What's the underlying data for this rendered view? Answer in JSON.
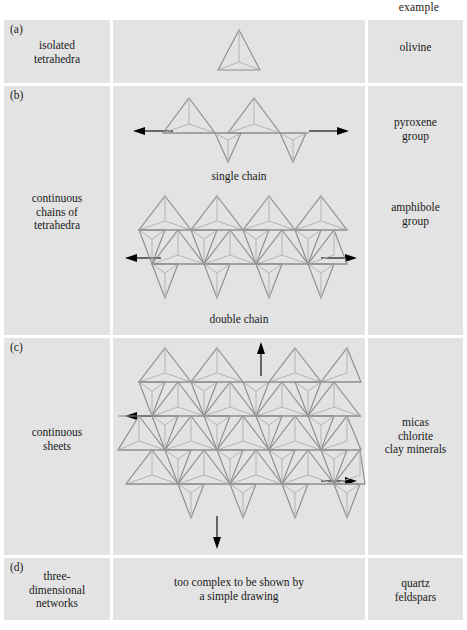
{
  "figure": {
    "title_header": "example",
    "background_color": "#e3e3e3",
    "page_color": "#ffffff",
    "tetrahedron_edge_color": "#8e8e8e",
    "arrow_color": "#000000"
  },
  "columns": {
    "structure_label": "structure type",
    "diagram_label": "diagram",
    "example_label": "example"
  },
  "rows": [
    {
      "id": "a",
      "label": "(a)",
      "structure": "isolated\ntetrahedra",
      "example": "olivine",
      "diagram_type": "single-tetrahedron",
      "caption": ""
    },
    {
      "id": "b",
      "label": "(b)",
      "structure": "continuous\nchains of\ntetrahedra",
      "examples": [
        {
          "text": "pyroxene\ngroup",
          "caption": "single chain"
        },
        {
          "text": "amphibole\ngroup",
          "caption": "double chain"
        }
      ],
      "diagram_type": "chains"
    },
    {
      "id": "c",
      "label": "(c)",
      "structure": "continuous\nsheets",
      "example": "micas\nchlorite\nclay minerals",
      "diagram_type": "sheet",
      "caption": ""
    },
    {
      "id": "d",
      "label": "(d)",
      "structure": "three-\ndimensional\nnetworks",
      "example": "quartz\nfeldspars",
      "diagram_type": "text-only",
      "diagram_text": "too complex to be shown by\na simple drawing"
    }
  ],
  "captions": {
    "single_chain": "single chain",
    "double_chain": "double chain"
  }
}
